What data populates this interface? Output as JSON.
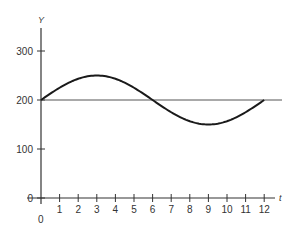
{
  "chart_data": {
    "type": "line",
    "title": "",
    "xlabel": "t",
    "ylabel": "Y",
    "origin_label": "0",
    "xlim": [
      0,
      12
    ],
    "ylim": [
      0,
      300
    ],
    "x_ticks": [
      1,
      2,
      3,
      4,
      5,
      6,
      7,
      8,
      9,
      10,
      11,
      12
    ],
    "x_tick_labels": [
      "1",
      "2",
      "3",
      "4",
      "5",
      "6",
      "7",
      "8",
      "9",
      "10",
      "11",
      "12"
    ],
    "y_ticks": [
      0,
      100,
      200,
      300
    ],
    "y_tick_labels": [
      "0",
      "100",
      "200",
      "300"
    ],
    "grid": false,
    "legend": null,
    "series": [
      {
        "name": "Y(t)",
        "description": "sinusoid, Y = 200 + 50 sin(pi t / 6)",
        "x": [
          0,
          1,
          2,
          3,
          4,
          5,
          6,
          7,
          8,
          9,
          10,
          11,
          12
        ],
        "values": [
          200,
          225,
          243,
          250,
          243,
          225,
          200,
          175,
          157,
          150,
          157,
          175,
          200
        ]
      }
    ],
    "reference_lines": [
      {
        "orientation": "horizontal",
        "y": 200,
        "label": ""
      }
    ],
    "colors": {
      "curve": "#1a1a1a",
      "axis": "#333333",
      "reference": "#555555"
    }
  }
}
